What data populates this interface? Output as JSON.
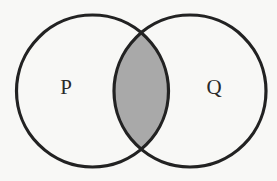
{
  "diagram": {
    "type": "venn",
    "sets": [
      {
        "id": "P",
        "label": "P",
        "cx": 92.5,
        "cy": 91,
        "r": 76
      },
      {
        "id": "Q",
        "label": "Q",
        "cx": 190,
        "cy": 91,
        "r": 76
      }
    ],
    "shaded_region": "P ∩ Q",
    "colors": {
      "background": "#f8f8f6",
      "outline": "#222222",
      "intersection_fill": "#a9a9a9",
      "label": "#2a2a2a"
    }
  }
}
